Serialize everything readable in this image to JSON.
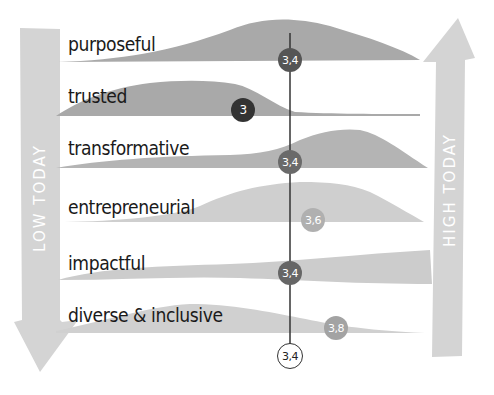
{
  "diagram": {
    "left_axis_label": "LOW TODAY",
    "right_axis_label": "HIGH TODAY",
    "reference_line": {
      "value": "3,4",
      "x": 290
    },
    "colors": {
      "background": "#ffffff",
      "arrow": "#d4d4d4",
      "shape_dark": "#a9a9a9",
      "shape_mid": "#b9b9b9",
      "shape_light": "#cfcfcf",
      "badge_darkest": "#333333",
      "badge_dark": "#555555",
      "badge_mid": "#6a6a6a",
      "badge_light": "#b0b0b0",
      "badge_lighter": "#a3a3a3",
      "line": "#333333"
    },
    "rows": [
      {
        "label": "purposeful",
        "score": "3,4"
      },
      {
        "label": "trusted",
        "score": "3"
      },
      {
        "label": "transformative",
        "score": "3,4"
      },
      {
        "label": "entrepreneurial",
        "score": "3,6"
      },
      {
        "label": "impactful",
        "score": "3,4"
      },
      {
        "label": "diverse & inclusive",
        "score": "3,8"
      }
    ],
    "overall_score": "3,4"
  }
}
